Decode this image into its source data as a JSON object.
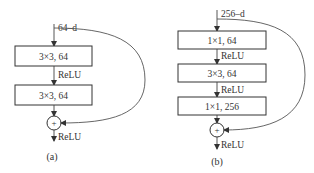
{
  "diagram": {
    "type": "residual-block-comparison",
    "colors": {
      "stroke": "#333333",
      "background": "#ffffff",
      "text": "#333333"
    },
    "blocks": [
      {
        "caption": "(a)",
        "input_label": "64–d",
        "layers": [
          {
            "label": "3×3, 64"
          },
          {
            "label": "3×3, 64"
          }
        ],
        "between_labels": [
          "ReLU"
        ],
        "sum_symbol": "+",
        "output_label": "ReLU"
      },
      {
        "caption": "(b)",
        "input_label": "256–d",
        "layers": [
          {
            "label": "1×1, 64"
          },
          {
            "label": "3×3, 64"
          },
          {
            "label": "1×1, 256"
          }
        ],
        "between_labels": [
          "ReLU",
          "ReLU"
        ],
        "sum_symbol": "+",
        "output_label": "ReLU"
      }
    ]
  }
}
